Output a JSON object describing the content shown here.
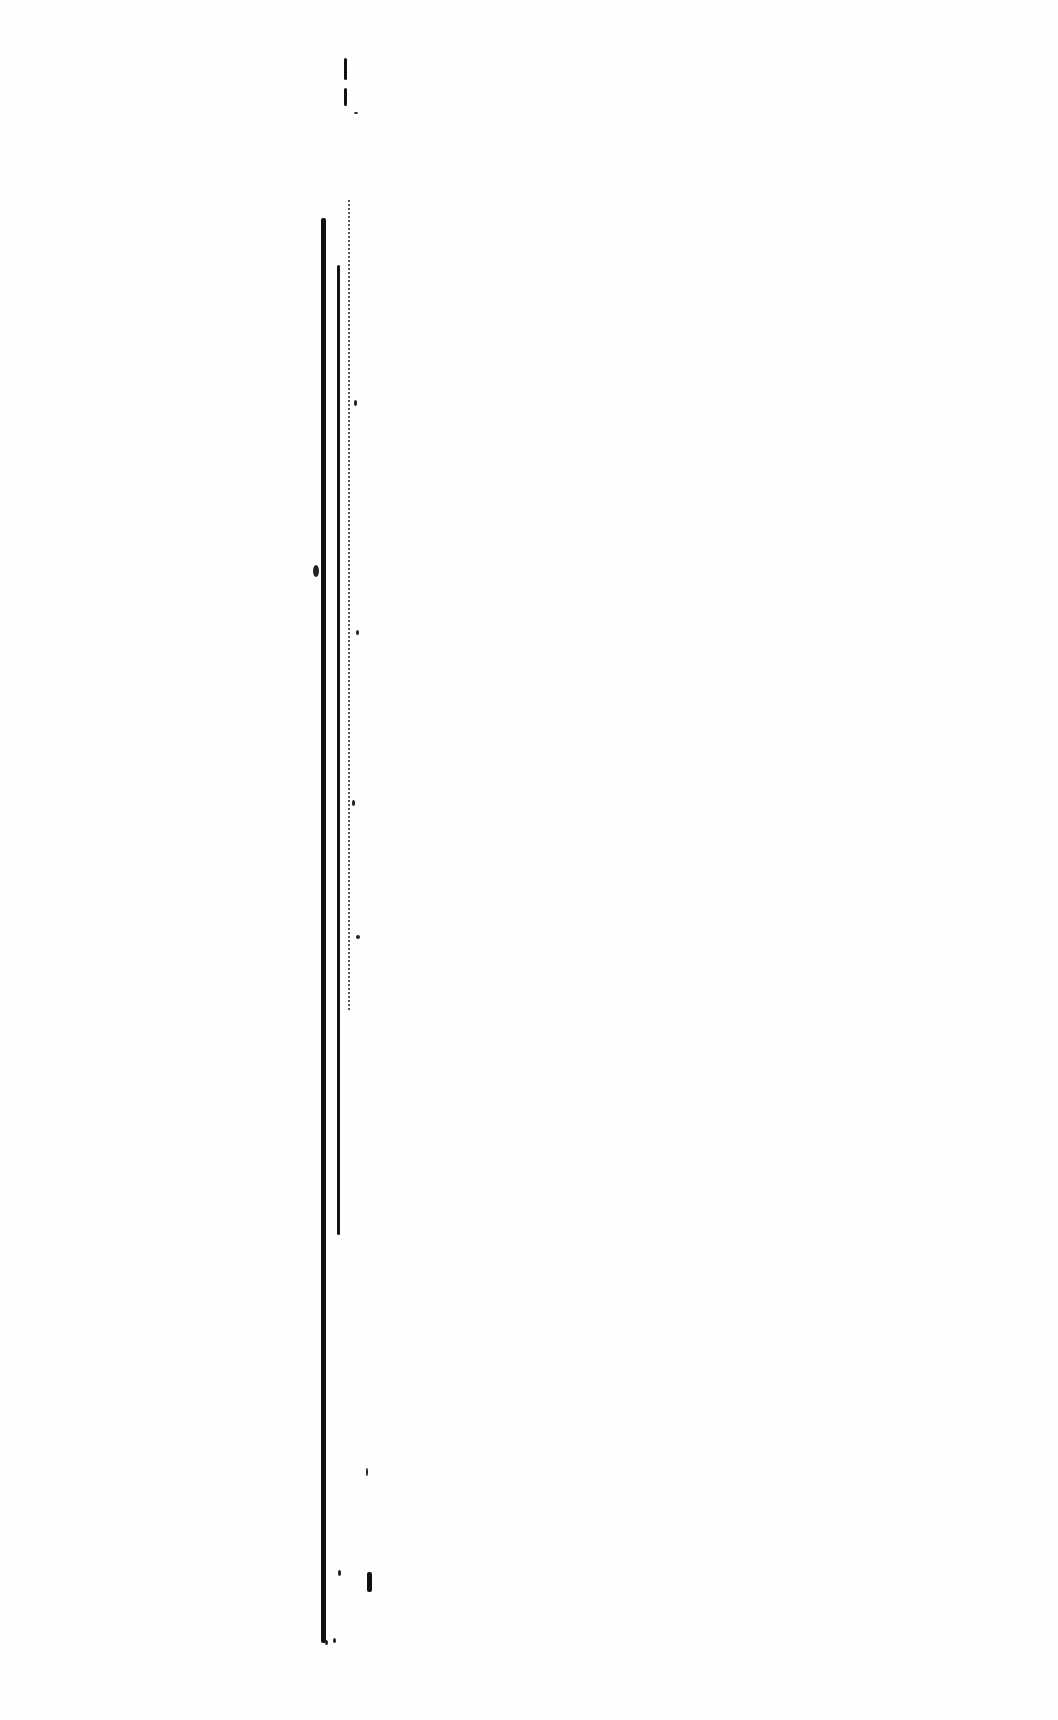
{
  "document": {
    "type": "scanned-page",
    "content": "blank page with vertical gutter/edge scan artifacts",
    "text": ""
  },
  "colors": {
    "background": "#fefefe",
    "ink": "#111111"
  }
}
